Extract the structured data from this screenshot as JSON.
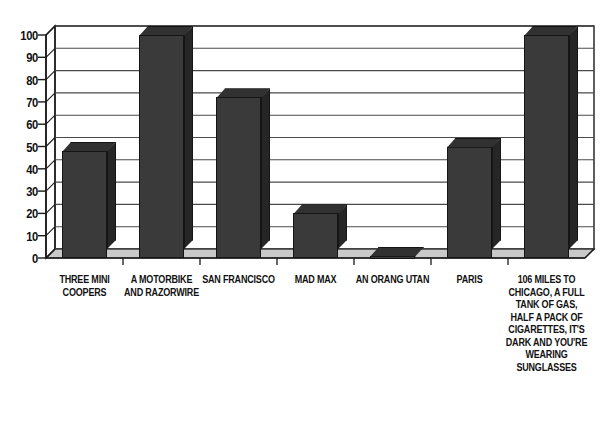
{
  "chart_data": {
    "type": "bar",
    "title": "",
    "subtitle": "",
    "xlabel": "",
    "ylabel": "",
    "ylim": [
      0,
      100
    ],
    "ytick_step": 10,
    "yticks": [
      100,
      90,
      80,
      70,
      60,
      50,
      40,
      30,
      20,
      10,
      0
    ],
    "grid": true,
    "legend": false,
    "legend_position": "none",
    "style": "3d-column",
    "categories": [
      "THREE MINI COOPERS",
      "A MOTORBIKE AND RAZORWIRE",
      "SAN FRANCISCO",
      "MAD MAX",
      "AN ORANG UTAN",
      "PARIS",
      "106 MILES TO CHICAGO, A FULL TANK OF GAS, HALF A PACK OF CIGARETTES, IT'S DARK AND YOU'RE WEARING SUNGLASSES"
    ],
    "values": [
      48,
      100,
      72,
      20,
      1,
      50,
      100
    ],
    "series": [
      {
        "name": "Series 1",
        "values": [
          48,
          100,
          72,
          20,
          1,
          50,
          100
        ]
      }
    ]
  },
  "colors": {
    "background": "#ffffff",
    "bar_front": "#3a3a3a",
    "bar_side": "#262626",
    "bar_top": "#313131",
    "bar_outline": "#151515",
    "axis": "#1a1a1a",
    "grid": "#4a4a4a",
    "floor": "#c9c9c9",
    "wall": "#ffffff",
    "text": "#111111"
  }
}
